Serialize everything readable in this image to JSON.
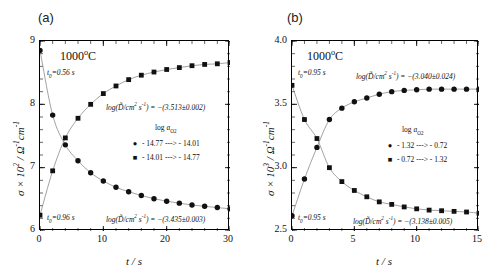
{
  "figure": {
    "panel_a_tag": "(a)",
    "panel_b_tag": "(b)"
  },
  "chart_data": [
    {
      "type": "scatter",
      "panel": "(a)",
      "title": "1000°C",
      "xlabel": "t / s",
      "ylabel": "σ × 10² / Ω⁻¹cm⁻¹",
      "xlim": [
        0,
        30
      ],
      "ylim": [
        6,
        9
      ],
      "xticks": [
        "0",
        "10",
        "20",
        "30"
      ],
      "xtick_values": [
        0,
        10,
        20,
        30
      ],
      "yticks": [
        "6",
        "7",
        "8",
        "9"
      ],
      "ytick_values": [
        6,
        7,
        8,
        9
      ],
      "grid": false,
      "minor_ticks": true,
      "legend_title": "log a(O2)",
      "legend_position": "center-right",
      "annotations": [
        {
          "name": "t0-reduction",
          "text": "t0=0.56 s"
        },
        {
          "name": "t0-oxidation",
          "text": "t0=0.96 s"
        },
        {
          "name": "dlog-upper",
          "text": "log(D/cm² s⁻¹) = −(3.513±0.002)"
        },
        {
          "name": "dlog-lower",
          "text": "log(D/cm² s⁻¹) = −(3.435±0.003)"
        }
      ],
      "series": [
        {
          "name": "-14.77 ---> -14.01",
          "marker": "circle",
          "legend_label": "- 14.77 ---> - 14.01",
          "x": [
            0,
            2,
            4,
            6,
            8,
            10,
            12,
            14,
            16,
            18,
            20,
            22,
            24,
            26,
            28,
            30
          ],
          "values": [
            8.85,
            7.83,
            7.36,
            7.11,
            6.92,
            6.79,
            6.69,
            6.62,
            6.56,
            6.51,
            6.47,
            6.44,
            6.41,
            6.39,
            6.37,
            6.35
          ]
        },
        {
          "name": "-14.01 ---> -14.77",
          "marker": "square",
          "legend_label": "- 14.01 ---> - 14.77",
          "x": [
            0,
            2,
            4,
            6,
            8,
            10,
            12,
            14,
            16,
            18,
            20,
            22,
            24,
            26,
            28,
            30
          ],
          "values": [
            6.25,
            6.95,
            7.47,
            7.78,
            8.0,
            8.17,
            8.29,
            8.39,
            8.46,
            8.51,
            8.55,
            8.58,
            8.61,
            8.63,
            8.64,
            8.66
          ]
        }
      ]
    },
    {
      "type": "scatter",
      "panel": "(b)",
      "title": "1000°C",
      "xlabel": "t / s",
      "ylabel": "σ × 10³ / Ω⁻¹cm⁻¹",
      "xlim": [
        0,
        15
      ],
      "ylim": [
        2.5,
        4.0
      ],
      "xticks": [
        "0",
        "5",
        "10",
        "15"
      ],
      "xtick_values": [
        0,
        5,
        10,
        15
      ],
      "yticks": [
        "2.5",
        "3.0",
        "3.5",
        "4.0"
      ],
      "ytick_values": [
        2.5,
        3.0,
        3.5,
        4.0
      ],
      "grid": false,
      "minor_ticks": true,
      "legend_title": "log a(O2)",
      "legend_position": "center-right",
      "annotations": [
        {
          "name": "t0-upper",
          "text": "t0=0.95 s"
        },
        {
          "name": "t0-lower",
          "text": "t0=0.95 s"
        },
        {
          "name": "dlog-upper",
          "text": "log(D/cm² s⁻¹) = −(3.040±0.024)"
        },
        {
          "name": "dlog-lower",
          "text": "log(D/cm² s⁻¹) = −(3.138±0.005)"
        }
      ],
      "series": [
        {
          "name": "-1.32 ---> -0.72",
          "marker": "circle",
          "legend_label": "- 1.32 ---> - 0.72",
          "x": [
            0,
            1,
            2,
            3,
            4,
            5,
            6,
            7,
            8,
            9,
            10,
            11,
            12,
            13,
            14,
            15
          ],
          "values": [
            2.62,
            2.91,
            3.16,
            3.38,
            3.47,
            3.52,
            3.55,
            3.58,
            3.6,
            3.61,
            3.615,
            3.62,
            3.62,
            3.62,
            3.62,
            3.62
          ]
        },
        {
          "name": "-0.72 ---> -1.32",
          "marker": "square",
          "legend_label": "- 0.72 ---> - 1.32",
          "x": [
            0,
            1,
            2,
            3,
            4,
            5,
            6,
            7,
            8,
            9,
            10,
            11,
            12,
            13,
            14,
            15
          ],
          "values": [
            3.65,
            3.38,
            3.23,
            3.0,
            2.89,
            2.82,
            2.77,
            2.73,
            2.71,
            2.69,
            2.675,
            2.665,
            2.66,
            2.655,
            2.65,
            2.64
          ]
        }
      ]
    }
  ],
  "panel_a": {
    "tag": "(a)",
    "temp": "1000",
    "temp_unit": "C",
    "t0_upper": "=0.56 s",
    "t0_lower": "=0.96 s",
    "t0_sym": "t",
    "t0_sub": "0",
    "dlog_upper_pre": "log(",
    "dlog_upper_mid": "/cm",
    "dlog_upper_post": ") = −(3.513±0.002)",
    "dlog_lower_post": ") = −(3.435±0.003)",
    "legend_title_pre": "log ",
    "legend_title_a": "a",
    "legend_title_sub": "O",
    "legend_title_sub2": "2",
    "legend_1": "- 14.77 ---> - 14.01",
    "legend_2": "- 14.01 ---> - 14.77",
    "ylab_sigma": "σ",
    "ylab_times": " × 10",
    "ylab_exp": "2",
    "ylab_tail": " / Ω",
    "ylab_exp2": "-1",
    "ylab_cm": "cm",
    "ylab_exp3": "-1",
    "xlab_t": "t",
    "xlab_s": " / s",
    "yticks": [
      "9",
      "8",
      "7",
      "6"
    ],
    "xticks": [
      "0",
      "10",
      "20",
      "30"
    ]
  },
  "panel_b": {
    "tag": "(b)",
    "temp": "1000",
    "temp_unit": "C",
    "t0_upper": "=0.95 s",
    "t0_lower": "=0.95 s",
    "t0_sym": "t",
    "t0_sub": "0",
    "dlog_upper_post": ") = −(3.040±0.024)",
    "dlog_lower_post": ") = −(3.138±0.005)",
    "dlog_pre": "log(",
    "dlog_mid": "/cm",
    "legend_title_pre": "log ",
    "legend_title_a": "a",
    "legend_title_sub": "O",
    "legend_title_sub2": "2",
    "legend_1": "- 1.32 ---> - 0.72",
    "legend_2": "- 0.72 ---> - 1.32",
    "ylab_sigma": "σ",
    "ylab_times": " × 10",
    "ylab_exp": "3",
    "ylab_tail": " / Ω",
    "ylab_exp2": "-1",
    "ylab_cm": "cm",
    "ylab_exp3": "-1",
    "xlab_t": "t",
    "xlab_s": " / s",
    "yticks": [
      "4.0",
      "3.5",
      "3.0",
      "2.5"
    ],
    "xticks": [
      "0",
      "5",
      "10",
      "15"
    ]
  }
}
